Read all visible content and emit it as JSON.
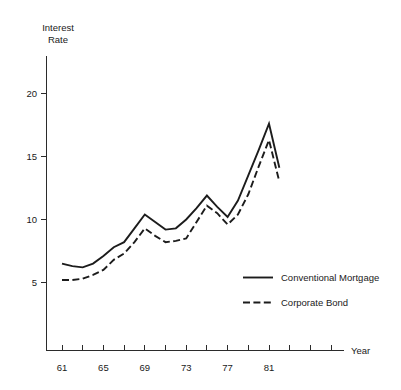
{
  "chart_data": {
    "type": "line",
    "title": "",
    "xlabel": "Year",
    "ylabel": "Interest Rate",
    "ylabel_lines": [
      "Interest",
      "Rate"
    ],
    "x": [
      61,
      62,
      63,
      64,
      65,
      66,
      67,
      68,
      69,
      70,
      71,
      72,
      73,
      74,
      75,
      76,
      77,
      78,
      79,
      80,
      81,
      82
    ],
    "xlim": [
      60,
      88
    ],
    "ylim": [
      0,
      22.5
    ],
    "grid": false,
    "legend_position": "inside-lower-right",
    "xticks": [
      61,
      63,
      65,
      67,
      69,
      71,
      73,
      75,
      77,
      79,
      81,
      83,
      85,
      87
    ],
    "xtick_labels": [
      "61",
      "",
      "65",
      "",
      "69",
      "",
      "73",
      "",
      "77",
      "",
      "81",
      "",
      "",
      ""
    ],
    "xtick_labels_shown": [
      "61",
      "65",
      "69",
      "73",
      "77",
      "81"
    ],
    "yticks": [
      5,
      10,
      15,
      20
    ],
    "ytick_labels": [
      "5",
      "10",
      "15",
      "20"
    ],
    "series": [
      {
        "name": "Conventional Mortgage",
        "style": "solid",
        "color": "#1c1c1c",
        "values": [
          6.5,
          6.3,
          6.2,
          6.5,
          7.1,
          7.8,
          8.2,
          9.3,
          10.4,
          9.8,
          9.2,
          9.3,
          10.0,
          10.9,
          11.9,
          11.0,
          10.2,
          11.5,
          13.5,
          15.5,
          17.6,
          14.1
        ]
      },
      {
        "name": "Corporate Bond",
        "style": "dashed",
        "color": "#1c1c1c",
        "values": [
          5.2,
          5.2,
          5.3,
          5.6,
          6.0,
          6.8,
          7.3,
          8.2,
          9.3,
          8.7,
          8.2,
          8.3,
          8.5,
          9.8,
          11.1,
          10.5,
          9.6,
          10.4,
          12.0,
          14.2,
          16.3,
          13.0
        ]
      }
    ]
  },
  "legend": {
    "items": [
      {
        "label": "Conventional Mortgage",
        "style": "solid"
      },
      {
        "label": "Corporate Bond",
        "style": "dashed"
      }
    ]
  },
  "axis": {
    "y_title_line1": "Interest",
    "y_title_line2": "Rate",
    "x_title": "Year"
  }
}
